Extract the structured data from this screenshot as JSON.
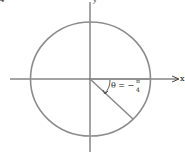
{
  "diagram": {
    "axis_x_label": "x",
    "axis_y_label": "y",
    "angle_label": "θ = −",
    "angle_frac_num": "π",
    "angle_frac_den": "4",
    "corner_mark": "4",
    "colors": {
      "circle": "#8c8c8c",
      "axis": "#333333",
      "radius": "#8c8c8c"
    }
  }
}
